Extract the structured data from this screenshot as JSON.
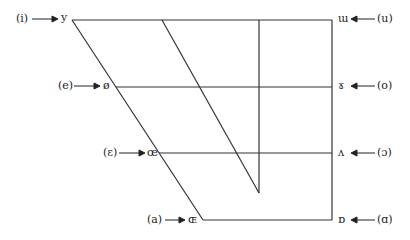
{
  "diagram": {
    "type": "vowel-chart",
    "line_color": "#333333",
    "left_side": [
      {
        "input": "(i)",
        "symbol": "y"
      },
      {
        "input": "(e)",
        "symbol": "ø"
      },
      {
        "input": "(ɛ)",
        "symbol": "œ"
      },
      {
        "input": "(a)",
        "symbol": "ɶ"
      }
    ],
    "right_side": [
      {
        "symbol": "ɯ",
        "input": "(u)"
      },
      {
        "symbol": "ɤ",
        "input": "(o)"
      },
      {
        "symbol": "ʌ",
        "input": "(ɔ)"
      },
      {
        "symbol": "ɒ",
        "input": "(ɑ)"
      }
    ]
  }
}
